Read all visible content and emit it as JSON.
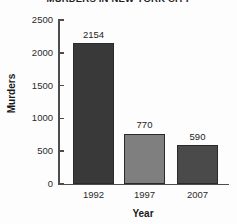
{
  "chart_data": {
    "type": "bar",
    "title": "MURDERS IN NEW YORK CITY",
    "xlabel": "Year",
    "ylabel": "Murders",
    "categories": [
      "1992",
      "1997",
      "2007"
    ],
    "values": [
      2154,
      770,
      590
    ],
    "value_labels": [
      "2154",
      "770",
      "590"
    ],
    "ylim": [
      0,
      2500
    ],
    "y_ticks": [
      0,
      500,
      1000,
      1500,
      2000,
      2500
    ],
    "y_tick_labels": [
      "0",
      "500",
      "1000",
      "1500",
      "2000",
      "2500"
    ],
    "grid": false,
    "legend": false,
    "bar_colors": [
      "#393939",
      "#7f7f7f",
      "#4a4a4a"
    ],
    "axis_color": "#4d4d4d",
    "background": "#fdfdfd"
  }
}
